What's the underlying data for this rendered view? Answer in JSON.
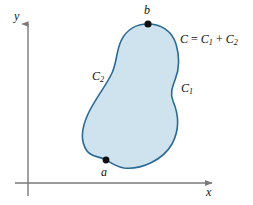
{
  "figure": {
    "background_color": "#ffffff",
    "curve": {
      "fill_color": "#cfe3ee",
      "stroke_color": "#2b6a94",
      "stroke_width": 1.6
    },
    "axes": {
      "color": "#7a7a7a",
      "line_width": 1.4,
      "origin": {
        "x": 28,
        "y": 183
      },
      "x_label": "x",
      "y_label": "y"
    },
    "points": [
      {
        "name": "a",
        "label": "a",
        "x": 106,
        "y": 160,
        "color": "#111111",
        "radius": 3.4
      },
      {
        "name": "b",
        "label": "b",
        "x": 148,
        "y": 24,
        "color": "#111111",
        "radius": 3.6
      }
    ],
    "labels": {
      "c1": {
        "base": "C",
        "sub": "1"
      },
      "c2": {
        "base": "C",
        "sub": "2"
      },
      "sum": {
        "lhs": "C",
        "equals": "=",
        "term1_base": "C",
        "term1_sub": "1",
        "plus": "+",
        "term2_base": "C",
        "term2_sub": "2"
      }
    }
  }
}
